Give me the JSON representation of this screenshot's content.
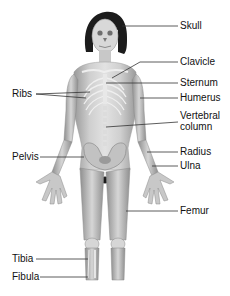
{
  "diagram": {
    "type": "anatomical-skeleton-overlay",
    "colors": {
      "background": "#ffffff",
      "hair": "#1c1c1c",
      "skin_light": "#d9d9d9",
      "skin_mid": "#b5b5b5",
      "skin_dark": "#8a8a8a",
      "bone": "#eeeeee",
      "leader_line": "#333333",
      "label_text": "#111111"
    }
  },
  "labels": {
    "right": [
      {
        "id": "skull",
        "text": "Skull"
      },
      {
        "id": "clavicle",
        "text": "Clavicle"
      },
      {
        "id": "sternum",
        "text": "Sternum"
      },
      {
        "id": "humerus",
        "text": "Humerus"
      },
      {
        "id": "vertebral",
        "line1": "Vertebral",
        "line2": "column"
      },
      {
        "id": "radius",
        "text": "Radius"
      },
      {
        "id": "ulna",
        "text": "Ulna"
      },
      {
        "id": "femur",
        "text": "Femur"
      }
    ],
    "left": [
      {
        "id": "ribs",
        "text": "Ribs"
      },
      {
        "id": "pelvis",
        "text": "Pelvis"
      },
      {
        "id": "tibia",
        "text": "Tibia"
      },
      {
        "id": "fibula",
        "text": "Fibula"
      }
    ]
  }
}
